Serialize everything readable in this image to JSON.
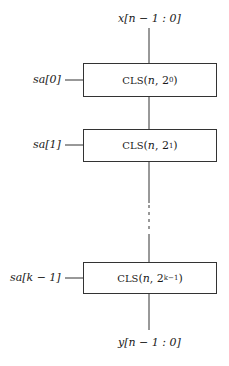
{
  "diagram": {
    "input_label": "x[n − 1 : 0]",
    "output_label": "y[n − 1 : 0]",
    "stages": [
      {
        "select_label": "sa[0]",
        "block_name": "CLS",
        "arg_n": "n",
        "shift_base": "2",
        "shift_exp": "0"
      },
      {
        "select_label": "sa[1]",
        "block_name": "CLS",
        "arg_n": "n",
        "shift_base": "2",
        "shift_exp": "1"
      },
      {
        "select_label": "sa[k − 1]",
        "block_name": "CLS",
        "arg_n": "n",
        "shift_base": "2",
        "shift_exp": "k−1"
      }
    ],
    "colors": {
      "line": "#333333",
      "background": "#ffffff"
    }
  }
}
